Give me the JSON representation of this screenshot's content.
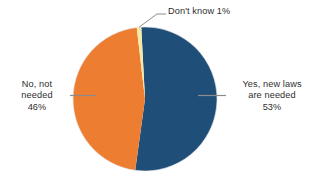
{
  "chart_data": {
    "type": "pie",
    "title": "",
    "subtitle": "",
    "xlabel": "",
    "ylabel": "",
    "legend_position": "labels-outside",
    "grid": false,
    "background_color": "#ffffff",
    "categories": [
      "Yes, new laws are needed",
      "No, not needed",
      "Don't know"
    ],
    "values": [
      53,
      46,
      1
    ],
    "value_unit": "%",
    "colors": [
      "#1F4E79",
      "#ED7D31",
      "#F5E9A8"
    ],
    "start_angle_deg": -3,
    "direction": "clockwise",
    "slices": [
      {
        "name": "yes",
        "label_lines": [
          "Yes, new laws",
          "are needed",
          "53%"
        ],
        "value": 53,
        "value_text": "53%",
        "color": "#1F4E79",
        "leader": true
      },
      {
        "name": "no",
        "label_lines": [
          "No, not",
          "needed",
          "46%"
        ],
        "value": 46,
        "value_text": "46%",
        "color": "#ED7D31",
        "leader": true
      },
      {
        "name": "dont-know",
        "label_lines": [
          "Don't know 1%"
        ],
        "value": 1,
        "value_text": "1%",
        "color": "#F5E9A8",
        "leader": true
      }
    ]
  },
  "labels": {
    "dont_know": {
      "line1": "Don't know 1%"
    },
    "no_not_needed": {
      "line1": "No, not",
      "line2": "needed",
      "line3": "46%"
    },
    "yes_new_laws": {
      "line1": "Yes, new laws",
      "line2": "are needed",
      "line3": "53%"
    }
  },
  "style": {
    "text_color": "#2e2e2e",
    "leader_color": "#8c8c8c",
    "background": "#ffffff"
  }
}
